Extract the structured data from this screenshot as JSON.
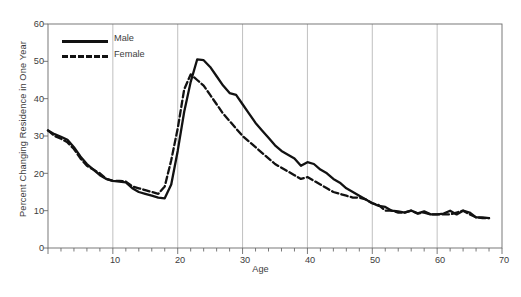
{
  "chart_data": {
    "type": "line",
    "title": "",
    "xlabel": "Age",
    "ylabel": "Percent Changing Residence in One Year",
    "xlim": [
      0,
      70
    ],
    "ylim": [
      0,
      60
    ],
    "xticks": [
      10,
      20,
      30,
      40,
      50,
      60,
      70
    ],
    "yticks": [
      0,
      10,
      20,
      30,
      40,
      50,
      60
    ],
    "xtick_step_minor": 2,
    "grid": "vertical gridlines at each labeled x tick",
    "legend_position": "top-left inside plot",
    "x": [
      0,
      1,
      2,
      3,
      4,
      5,
      6,
      7,
      8,
      9,
      10,
      11,
      12,
      13,
      14,
      15,
      16,
      17,
      18,
      19,
      20,
      21,
      22,
      23,
      24,
      25,
      26,
      27,
      28,
      29,
      30,
      31,
      32,
      33,
      34,
      35,
      36,
      37,
      38,
      39,
      40,
      41,
      42,
      43,
      44,
      45,
      46,
      47,
      48,
      49,
      50,
      51,
      52,
      53,
      54,
      55,
      56,
      57,
      58,
      59,
      60,
      61,
      62,
      63,
      64,
      65,
      66,
      67,
      68
    ],
    "series": [
      {
        "name": "Male",
        "style": "solid",
        "color": "#121212",
        "values": [
          31.5,
          30.5,
          29.8,
          29.0,
          27.0,
          24.5,
          22.5,
          21.0,
          19.5,
          18.5,
          18.0,
          17.8,
          17.6,
          16.0,
          15.0,
          14.5,
          14.0,
          13.5,
          13.3,
          17.0,
          26.0,
          36.5,
          44.5,
          50.5,
          50.3,
          48.5,
          46.0,
          43.5,
          41.5,
          41.0,
          38.5,
          36.0,
          33.5,
          31.5,
          29.5,
          27.5,
          26.0,
          25.0,
          24.0,
          22.0,
          23.0,
          22.5,
          21.0,
          20.0,
          18.5,
          17.5,
          16.0,
          15.0,
          14.0,
          13.0,
          12.0,
          11.3,
          11.0,
          10.0,
          9.8,
          9.5,
          10.0,
          9.3,
          9.8,
          9.0,
          9.0,
          9.2,
          10.0,
          9.0,
          10.0,
          9.5,
          8.2,
          8.2,
          8.0
        ]
      },
      {
        "name": "Female",
        "style": "dashed",
        "color": "#121212",
        "values": [
          31.5,
          30.0,
          29.3,
          28.3,
          26.5,
          24.0,
          22.0,
          21.0,
          20.0,
          18.5,
          18.0,
          18.0,
          17.8,
          16.5,
          16.0,
          15.5,
          15.0,
          14.5,
          16.5,
          23.5,
          32.0,
          42.5,
          46.5,
          45.0,
          43.5,
          41.0,
          38.5,
          36.0,
          34.0,
          32.0,
          30.0,
          28.5,
          27.0,
          25.5,
          24.0,
          22.5,
          21.5,
          20.5,
          19.5,
          18.5,
          19.0,
          18.0,
          17.0,
          16.0,
          15.0,
          14.5,
          14.0,
          13.5,
          13.5,
          13.0,
          12.0,
          11.5,
          10.0,
          10.0,
          9.5,
          9.5,
          10.0,
          9.2,
          9.5,
          9.0,
          9.0,
          9.0,
          9.0,
          9.5,
          10.0,
          9.0,
          8.2,
          8.0,
          8.0
        ]
      }
    ],
    "peaks": {
      "male": {
        "age": 23,
        "value": 50.5
      },
      "female": {
        "age": 22,
        "value": 46.5
      }
    },
    "troughs": {
      "male": {
        "age": 18,
        "value": 13.3
      },
      "female": {
        "age": 17,
        "value": 14.5
      }
    }
  },
  "legend": {
    "items": [
      {
        "label": "Male",
        "style": "solid"
      },
      {
        "label": "Female",
        "style": "dashed"
      }
    ]
  },
  "axes": {
    "y_title": "Percent Changing Residence in One Year",
    "x_title": "Age",
    "y_tick_labels": [
      "0",
      "10",
      "20",
      "30",
      "40",
      "50",
      "60"
    ],
    "x_tick_labels": [
      "10",
      "20",
      "30",
      "40",
      "50",
      "60",
      "70"
    ]
  },
  "caption": {
    "text": ""
  },
  "colors": {
    "line": "#121212",
    "axis": "#6b6b6b",
    "grid": "#b0b0b0",
    "text": "#3c3c3c",
    "background": "#ffffff"
  }
}
